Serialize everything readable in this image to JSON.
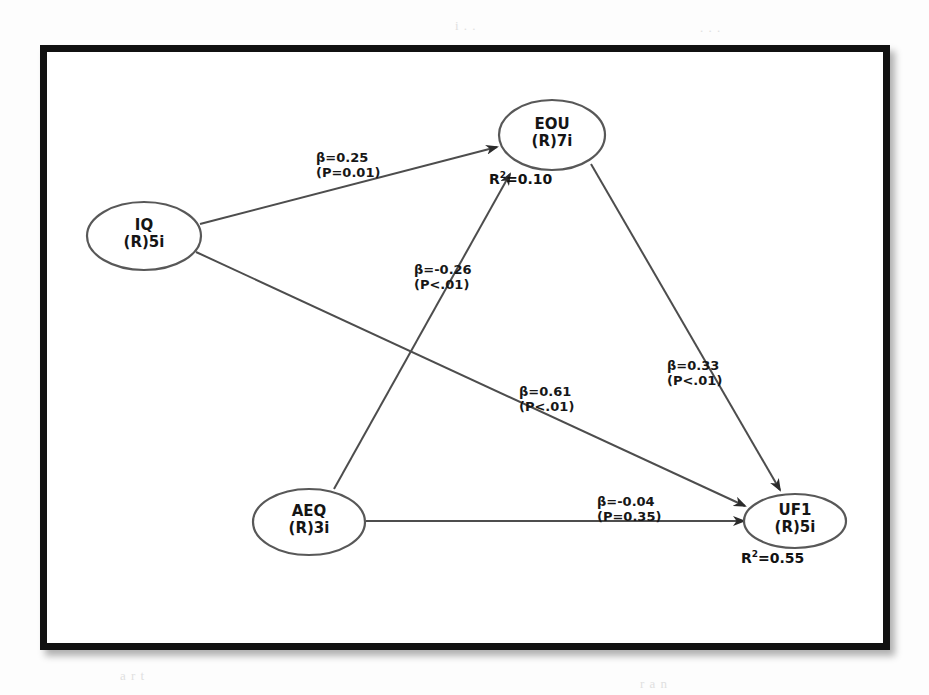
{
  "figure": {
    "type": "path-diagram",
    "frame_color": "#111111",
    "background_color": "#ffffff",
    "line_color": "#4d4d4d"
  },
  "nodes": [
    {
      "id": "IQ",
      "line1": "IQ",
      "line2": "(R)5i",
      "cx": 144,
      "cy": 236,
      "rx": 57,
      "ry": 34
    },
    {
      "id": "EOU",
      "line1": "EOU",
      "line2": "(R)7i",
      "cx": 552,
      "cy": 135,
      "rx": 53,
      "ry": 35
    },
    {
      "id": "AEQ",
      "line1": "AEQ",
      "line2": "(R)3i",
      "cx": 309,
      "cy": 522,
      "rx": 56,
      "ry": 33
    },
    {
      "id": "UF1",
      "line1": "UF1",
      "line2": "(R)5i",
      "cx": 795,
      "cy": 521,
      "rx": 51,
      "ry": 27
    }
  ],
  "r_squared": [
    {
      "for": "EOU",
      "text_prefix": "R",
      "exponent": "2",
      "text_suffix": "=0.10",
      "full": "R2=0.10",
      "x": 489,
      "y": 170
    },
    {
      "for": "UF1",
      "text_prefix": "R",
      "exponent": "2",
      "text_suffix": "=0.55",
      "full": "R2=0.55",
      "x": 741,
      "y": 549
    }
  ],
  "edges": [
    {
      "id": "iq-eou",
      "from": "IQ",
      "to": "EOU",
      "beta": "β=0.25",
      "p": "(P=0.01)",
      "label_x": 316,
      "label_y": 150,
      "x1": 200,
      "y1": 224,
      "x2": 497,
      "y2": 147
    },
    {
      "id": "iq-uf1",
      "from": "IQ",
      "to": "UF1",
      "beta": "β=0.61",
      "p": "(P<.01)",
      "label_x": 519,
      "label_y": 384,
      "x1": 196,
      "y1": 252,
      "x2": 745,
      "y2": 506
    },
    {
      "id": "aeq-eou",
      "from": "AEQ",
      "to": "EOU",
      "beta": "β=-0.26",
      "p": "(P<.01)",
      "label_x": 414,
      "label_y": 262,
      "x1": 334,
      "y1": 489,
      "x2": 510,
      "y2": 174
    },
    {
      "id": "aeq-uf1",
      "from": "AEQ",
      "to": "UF1",
      "beta": "β=-0.04",
      "p": "(P=0.35)",
      "label_x": 597,
      "label_y": 494,
      "x1": 366,
      "y1": 521,
      "x2": 744,
      "y2": 521
    },
    {
      "id": "eou-uf1",
      "from": "EOU",
      "to": "UF1",
      "beta": "β=0.33",
      "p": "(P<.01)",
      "label_x": 667,
      "label_y": 358,
      "x1": 591,
      "y1": 164,
      "x2": 780,
      "y2": 490
    }
  ],
  "ghost_text": [
    {
      "text": "i  .  .",
      "x": 455,
      "y": 18
    },
    {
      "text": ". . .",
      "x": 700,
      "y": 20
    },
    {
      "text": "a  r  t",
      "x": 120,
      "y": 668
    },
    {
      "text": ".   .   .",
      "x": 430,
      "y": 612
    },
    {
      "text": "r  a  n",
      "x": 640,
      "y": 676
    }
  ]
}
